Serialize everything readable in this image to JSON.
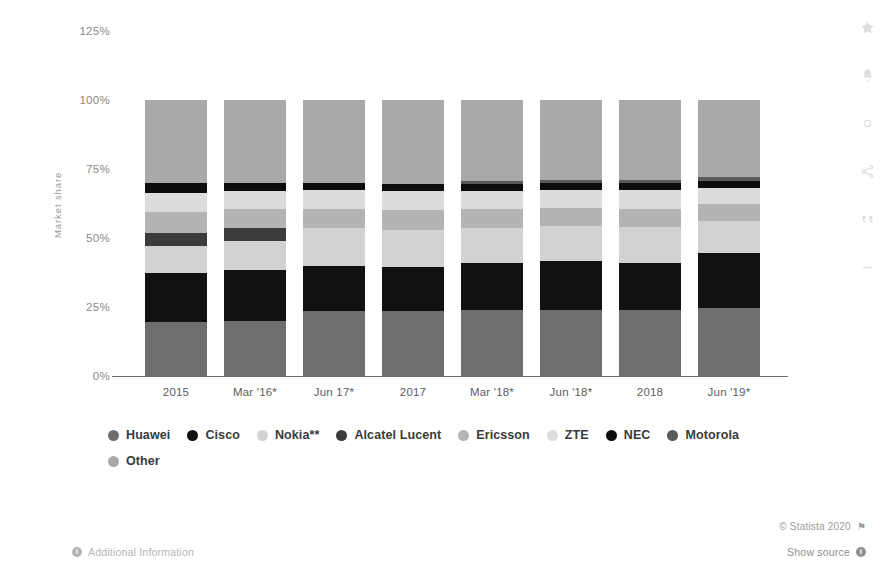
{
  "chart_data": {
    "type": "bar",
    "stacked": true,
    "title": "",
    "xlabel": "",
    "ylabel": "Market share",
    "ylim": [
      0,
      125
    ],
    "yticks": [
      "0%",
      "25%",
      "50%",
      "75%",
      "100%",
      "125%"
    ],
    "ytick_values": [
      0,
      25,
      50,
      75,
      100,
      125
    ],
    "grid": false,
    "legend_position": "bottom",
    "categories": [
      "2015",
      "Mar '16*",
      "Jun 17*",
      "2017",
      "Mar '18*",
      "Jun '18*",
      "2018",
      "Jun '19*"
    ],
    "series": [
      {
        "name": "Huawei",
        "color": "#6e6e6e",
        "values": [
          19.5,
          20.0,
          23.5,
          23.5,
          24.0,
          24.0,
          24.0,
          24.5
        ]
      },
      {
        "name": "Cisco",
        "color": "#111111",
        "values": [
          18.0,
          18.5,
          16.5,
          16.0,
          17.0,
          17.5,
          17.0,
          20.0
        ]
      },
      {
        "name": "Nokia**",
        "color": "#d2d2d2",
        "values": [
          9.5,
          10.5,
          13.5,
          13.5,
          12.5,
          13.0,
          13.0,
          11.5
        ]
      },
      {
        "name": "Alcatel Lucent",
        "color": "#3b3b3b",
        "values": [
          5.0,
          4.5,
          0.0,
          0.0,
          0.0,
          0.0,
          0.0,
          0.0
        ]
      },
      {
        "name": "Ericsson",
        "color": "#b4b4b4",
        "values": [
          7.5,
          7.0,
          7.0,
          7.0,
          7.0,
          6.5,
          6.5,
          6.5
        ]
      },
      {
        "name": "ZTE",
        "color": "#dcdcdc",
        "values": [
          7.0,
          6.5,
          7.0,
          7.0,
          6.5,
          6.5,
          7.0,
          5.5
        ]
      },
      {
        "name": "NEC",
        "color": "#0c0c0c",
        "values": [
          3.5,
          3.0,
          2.5,
          2.5,
          2.5,
          2.5,
          2.5,
          2.5
        ]
      },
      {
        "name": "Motorola",
        "color": "#5a5a5a",
        "values": [
          0.0,
          0.0,
          0.0,
          0.0,
          1.0,
          1.0,
          1.0,
          1.5
        ]
      },
      {
        "name": "Other",
        "color": "#a9a9a9",
        "values": [
          30.0,
          30.0,
          30.0,
          30.5,
          29.5,
          29.0,
          29.0,
          28.0
        ]
      }
    ]
  },
  "yaxis": {
    "title": "Market share",
    "ticks": [
      "125%",
      "100%",
      "75%",
      "50%",
      "25%",
      "0%"
    ]
  },
  "xaxis": {
    "ticks": [
      "2015",
      "Mar '16*",
      "Jun 17*",
      "2017",
      "Mar '18*",
      "Jun '18*",
      "2018",
      "Jun '19*"
    ]
  },
  "legend": {
    "row1": [
      {
        "label": "Huawei",
        "color": "#6e6e6e"
      },
      {
        "label": "Cisco",
        "color": "#111111"
      },
      {
        "label": "Nokia**",
        "color": "#d2d2d2"
      },
      {
        "label": "Alcatel Lucent",
        "color": "#3b3b3b"
      },
      {
        "label": "Ericsson",
        "color": "#b4b4b4"
      },
      {
        "label": "ZTE",
        "color": "#dcdcdc"
      },
      {
        "label": "NEC",
        "color": "#0c0c0c"
      },
      {
        "label": "Motorola",
        "color": "#5a5a5a"
      }
    ],
    "row2": [
      {
        "label": "Other",
        "color": "#a9a9a9"
      }
    ]
  },
  "rail": {
    "icons": [
      "star-icon",
      "bell-icon",
      "gear-icon",
      "share-icon",
      "quote-icon",
      "link-icon"
    ]
  },
  "footer": {
    "copyright": "© Statista 2020",
    "flag": "⚑",
    "additional_information": "Additional Information",
    "show_source": "Show source",
    "info_glyph": "i"
  }
}
